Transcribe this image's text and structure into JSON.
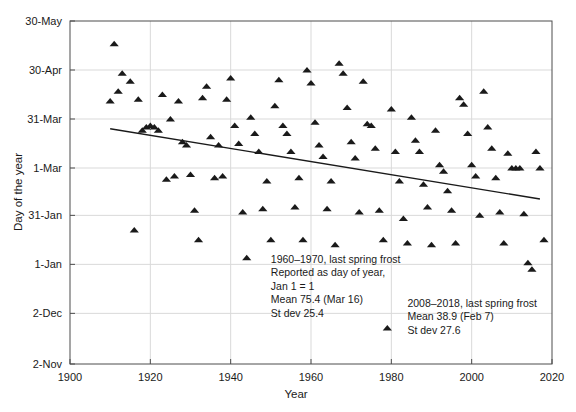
{
  "chart_data": {
    "type": "scatter",
    "title": "",
    "xlabel": "Year",
    "ylabel": "Day of the year",
    "xlim": [
      1900,
      2020
    ],
    "ylim": [
      -60,
      150
    ],
    "xticks": [
      1900,
      1920,
      1940,
      1960,
      1980,
      2000,
      2020
    ],
    "xticklabels": [
      "1900",
      "1920",
      "1940",
      "1960",
      "1980",
      "2000",
      "2020"
    ],
    "yticks": [
      150,
      120,
      90,
      60,
      31,
      1,
      -29,
      -60
    ],
    "yticklabels": [
      "30-May",
      "30-Apr",
      "31-Mar",
      "1-Mar",
      "31-Jan",
      "1-Jan",
      "2-Dec",
      "2-Nov"
    ],
    "grid": true,
    "legend": "none",
    "marker": "triangle",
    "marker_color": "#1a1a1a",
    "series": [
      {
        "name": "last spring frost",
        "points": [
          [
            1911,
            136
          ],
          [
            1912,
            107
          ],
          [
            1913,
            118
          ],
          [
            1910,
            101
          ],
          [
            1915,
            113
          ],
          [
            1917,
            102
          ],
          [
            1916,
            22
          ],
          [
            1918,
            83
          ],
          [
            1920,
            86
          ],
          [
            1921,
            85
          ],
          [
            1922,
            83
          ],
          [
            1919,
            85
          ],
          [
            1923,
            105
          ],
          [
            1925,
            90
          ],
          [
            1924,
            53
          ],
          [
            1926,
            55
          ],
          [
            1927,
            101
          ],
          [
            1928,
            76
          ],
          [
            1929,
            74
          ],
          [
            1930,
            56
          ],
          [
            1931,
            34
          ],
          [
            1932,
            16
          ],
          [
            1933,
            103
          ],
          [
            1934,
            110
          ],
          [
            1935,
            79
          ],
          [
            1936,
            54
          ],
          [
            1937,
            74
          ],
          [
            1938,
            55
          ],
          [
            1940,
            115
          ],
          [
            1939,
            102
          ],
          [
            1941,
            86
          ],
          [
            1942,
            75
          ],
          [
            1943,
            33
          ],
          [
            1944,
            5
          ],
          [
            1945,
            91
          ],
          [
            1946,
            81
          ],
          [
            1947,
            70
          ],
          [
            1948,
            35
          ],
          [
            1949,
            52
          ],
          [
            1950,
            16
          ],
          [
            1951,
            98
          ],
          [
            1952,
            114
          ],
          [
            1953,
            86
          ],
          [
            1954,
            81
          ],
          [
            1955,
            70
          ],
          [
            1956,
            36
          ],
          [
            1957,
            54
          ],
          [
            1958,
            16
          ],
          [
            1959,
            120
          ],
          [
            1960,
            112
          ],
          [
            1961,
            88
          ],
          [
            1962,
            74
          ],
          [
            1963,
            67
          ],
          [
            1964,
            35
          ],
          [
            1965,
            52
          ],
          [
            1966,
            13
          ],
          [
            1967,
            124
          ],
          [
            1968,
            118
          ],
          [
            1969,
            97
          ],
          [
            1970,
            76
          ],
          [
            1971,
            66
          ],
          [
            1972,
            33
          ],
          [
            1973,
            113
          ],
          [
            1974,
            87
          ],
          [
            1975,
            86
          ],
          [
            1976,
            72
          ],
          [
            1977,
            34
          ],
          [
            1978,
            16
          ],
          [
            1979,
            -38
          ],
          [
            1980,
            96
          ],
          [
            1981,
            70
          ],
          [
            1982,
            52
          ],
          [
            1983,
            29
          ],
          [
            1984,
            14
          ],
          [
            1985,
            91
          ],
          [
            1986,
            77
          ],
          [
            1987,
            70
          ],
          [
            1988,
            50
          ],
          [
            1989,
            36
          ],
          [
            1990,
            13
          ],
          [
            1991,
            83
          ],
          [
            1992,
            62
          ],
          [
            1993,
            58
          ],
          [
            1994,
            46
          ],
          [
            1995,
            34
          ],
          [
            1996,
            14
          ],
          [
            1997,
            103
          ],
          [
            1998,
            99
          ],
          [
            1999,
            81
          ],
          [
            2000,
            62
          ],
          [
            2001,
            55
          ],
          [
            2002,
            31
          ],
          [
            2003,
            107
          ],
          [
            2004,
            85
          ],
          [
            2005,
            72
          ],
          [
            2006,
            54
          ],
          [
            2007,
            33
          ],
          [
            2008,
            14
          ],
          [
            2009,
            69
          ],
          [
            2010,
            60
          ],
          [
            2011,
            60
          ],
          [
            2012,
            60
          ],
          [
            2013,
            32
          ],
          [
            2014,
            2
          ],
          [
            2015,
            -2
          ],
          [
            2016,
            70
          ],
          [
            2017,
            60
          ],
          [
            2018,
            16
          ]
        ]
      }
    ],
    "trendline": {
      "x": [
        1910,
        2017
      ],
      "y": [
        84,
        41
      ],
      "color": "#1a1a1a"
    },
    "annotations": [
      {
        "name": "annotation-early-period",
        "x": 1950,
        "y": 2,
        "lines": [
          "1960–1970, last spring frost",
          "Reported as day of year,",
          "Jan 1 = 1",
          "Mean  75.4 (Mar 16)",
          "St dev 25.4"
        ]
      },
      {
        "name": "annotation-late-period",
        "x": 1984,
        "y": -25,
        "lines": [
          "2008–2018, last spring frost",
          "Mean 38.9 (Feb 7)",
          "St dev 27.6"
        ]
      }
    ]
  }
}
